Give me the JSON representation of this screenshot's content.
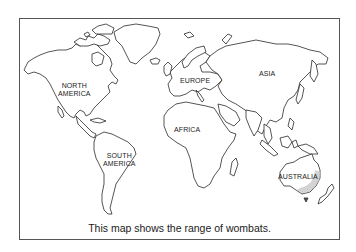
{
  "map": {
    "type": "world-outline",
    "frame_color": "#555555",
    "outline_color": "#2a2a2a",
    "highlight_color": "#8a8a8a",
    "highlighted_region": "eastern-australia",
    "labels": {
      "north_america": [
        "NORTH",
        "AMERICA"
      ],
      "south_america": [
        "SOUTH",
        "AMERICA"
      ],
      "europe": "EUROPE",
      "africa": "AFRICA",
      "asia": "ASIA",
      "australia": "AUSTRALIA"
    }
  },
  "caption": "This map shows the range of wombats."
}
